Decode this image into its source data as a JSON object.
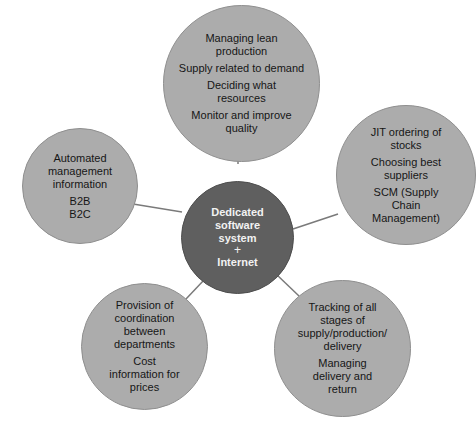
{
  "diagram": {
    "type": "hub-and-spoke",
    "center": {
      "lines": [
        "Dedicated",
        "software",
        "system"
      ],
      "plus": "+",
      "last": "Internet",
      "color": "#5f5f5f"
    },
    "outer_color": "#acacac",
    "line_color": "#7a7a7a",
    "nodes": [
      {
        "id": "top",
        "items": [
          [
            "Managing lean",
            "production"
          ],
          [
            "Supply related to demand"
          ],
          [
            "Deciding what",
            "resources"
          ],
          [
            "Monitor and improve",
            "quality"
          ]
        ]
      },
      {
        "id": "right",
        "items": [
          [
            "JIT ordering of",
            "stocks"
          ],
          [
            "Choosing best",
            "suppliers"
          ],
          [
            "SCM (Supply",
            "Chain",
            "Management)"
          ]
        ]
      },
      {
        "id": "bottom-right",
        "items": [
          [
            "Tracking of all",
            "stages of",
            "supply/production/",
            "delivery"
          ],
          [
            "Managing",
            "delivery and",
            "return"
          ]
        ]
      },
      {
        "id": "bottom-left",
        "items": [
          [
            "Provision of",
            "coordination",
            "between",
            "departments"
          ],
          [
            "Cost",
            "information for",
            "prices"
          ]
        ]
      },
      {
        "id": "left",
        "items": [
          [
            "Automated",
            "management",
            "information"
          ],
          [
            "B2B",
            "B2C"
          ]
        ]
      }
    ]
  }
}
